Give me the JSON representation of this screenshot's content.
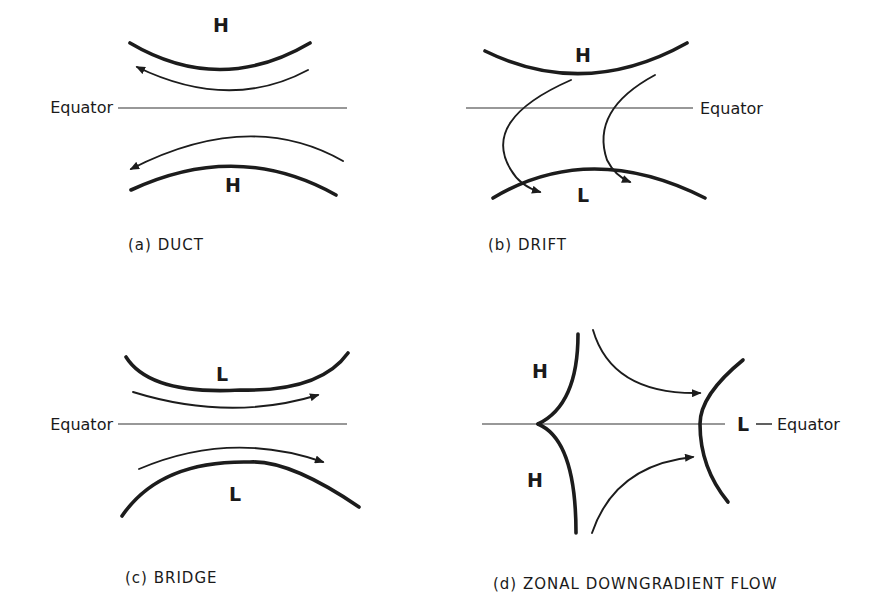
{
  "figure": {
    "panels": [
      {
        "id": "a",
        "caption": "(a) DUCT",
        "caption_pos": [
          128,
          250
        ],
        "equator": {
          "label": "Equator",
          "label_pos": [
            113,
            113
          ],
          "label_anchor": "end",
          "line": [
            118,
            108,
            347,
            108
          ]
        },
        "pressure_labels": [
          {
            "text": "H",
            "pos": [
              221,
              32
            ]
          },
          {
            "text": "H",
            "pos": [
              233,
              192
            ]
          }
        ],
        "isobars": [
          "M130 43 Q 220 96 310 43",
          "M131 190 Q 238 140 336 195"
        ],
        "flows": [
          {
            "d": "M308 70 Q 230 112 137 67",
            "head": [
              134,
              66,
              -160
            ]
          },
          {
            "d": "M343 161 Q 250 108 131 169",
            "head": [
              130,
              170,
              160
            ]
          }
        ]
      },
      {
        "id": "b",
        "caption": "(b) DRIFT",
        "caption_pos": [
          488,
          250
        ],
        "equator": {
          "label": "Equator",
          "label_pos": [
            700,
            114
          ],
          "label_anchor": "start",
          "line": [
            466,
            108,
            693,
            108
          ]
        },
        "pressure_labels": [
          {
            "text": "H",
            "pos": [
              583,
              62
            ]
          },
          {
            "text": "L",
            "pos": [
              583,
              202
            ]
          }
        ],
        "isobars": [
          "M485 51 Q 585 100 687 43",
          "M493 198 Q 590 140 705 198"
        ],
        "flows": [
          {
            "d": "M571 80 Q 480 120 511 170 Q 520 186 540 192",
            "head": [
              546,
              195,
              20
            ]
          },
          {
            "d": "M655 75 Q 590 110 607 160 Q 615 176 630 182",
            "head": [
              637,
              185,
              25
            ]
          }
        ]
      },
      {
        "id": "c",
        "caption": "(c) BRIDGE",
        "caption_pos": [
          125,
          583
        ],
        "equator": {
          "label": "Equator",
          "label_pos": [
            113,
            430
          ],
          "label_anchor": "end",
          "line": [
            118,
            424,
            347,
            424
          ]
        },
        "pressure_labels": [
          {
            "text": "L",
            "pos": [
              222,
              381
            ]
          },
          {
            "text": "L",
            "pos": [
              235,
              501
            ]
          }
        ],
        "isobars": [
          "M126 357 Q 150 395 240 390 Q 320 392 348 353",
          "M122 516 Q 160 460 250 462 Q 290 460 359 507"
        ],
        "flows": [
          {
            "d": "M133 392 Q 230 422 318 395",
            "head": [
              320,
              394,
              -12
            ]
          },
          {
            "d": "M139 469 Q 230 430 323 462",
            "head": [
              326,
              463,
              15
            ]
          }
        ]
      },
      {
        "id": "d",
        "caption": "(d) ZONAL  DOWNGRADIENT  FLOW",
        "caption_pos": [
          493,
          589
        ],
        "equator": {
          "label": "L — Equator",
          "label_pos": [
            737,
            430
          ],
          "label_anchor": "start",
          "line": [
            482,
            424,
            725,
            424
          ]
        },
        "pressure_labels": [
          {
            "text": "H",
            "pos": [
              540,
              378
            ]
          },
          {
            "text": "H",
            "pos": [
              535,
              487
            ]
          },
          {
            "text": "L",
            "pos": [
              737,
              431
            ]
          }
        ],
        "isobars": [
          "M578 334 Q 578 405 538 424",
          "M538 424 Q 576 440 576 533",
          "M743 360 Q 700 395 700 424 Q 700 468 728 502"
        ],
        "flows": [
          {
            "d": "M593 330 Q 612 395 700 393",
            "head": [
              703,
              393,
              0
            ]
          },
          {
            "d": "M592 533 Q 615 465 693 457",
            "head": [
              696,
              457,
              -10
            ]
          }
        ]
      }
    ],
    "equator_word": "Equator",
    "colors": {
      "ink": "#1c1c1c",
      "background": "#ffffff"
    }
  }
}
